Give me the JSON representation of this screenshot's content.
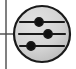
{
  "canvas": {
    "width": 76,
    "height": 69,
    "background_color": "#ffffff",
    "title": "Settings sliders icon"
  },
  "colors": {
    "stroke": "#1a1a1a",
    "circle_fill": "#d4d4d4",
    "circle_fill_highlight": "#e2e2e2",
    "circle_fill_shade": "#bdbdbd",
    "knob_fill": "#111111",
    "track": "#1a1a1a",
    "connector": "#4a4a4a",
    "background": "#ffffff"
  },
  "connector": {
    "vertical_line": {
      "label": "vertical-connector-line",
      "x": 6,
      "y1": 0,
      "y2": 69,
      "width": 1.4,
      "color": "#4a4a4a"
    },
    "horizontal_stub": {
      "label": "horizontal-connector-stub",
      "y": 34,
      "x1": 0,
      "x2": 15,
      "width": 1.4,
      "color": "#4a4a4a"
    }
  },
  "circle": {
    "label": "settings-circle",
    "center_x": 42,
    "center_y": 34,
    "radius_x": 28,
    "radius_y": 28,
    "stroke_width": 2.2,
    "fill": "#d4d4d4",
    "stroke": "#1a1a1a"
  },
  "sliders": {
    "count": 3,
    "track_stroke_width": 2.2,
    "knob_radius": 4.2,
    "knob_stroke_width": 1.4,
    "items": [
      {
        "name": "slider-row-1",
        "label": "Slider 1",
        "y": 22,
        "track_x1": 20,
        "track_x2": 64,
        "knob_x": 39,
        "value_percent": 43
      },
      {
        "name": "slider-row-2",
        "label": "Slider 2",
        "y": 34,
        "track_x1": 19,
        "track_x2": 65,
        "knob_x": 48,
        "value_percent": 63
      },
      {
        "name": "slider-row-3",
        "label": "Slider 3",
        "y": 46,
        "track_x1": 20,
        "track_x2": 64,
        "knob_x": 31,
        "value_percent": 25
      }
    ]
  },
  "accessibility": {
    "icon_name": "settings-sliders-icon",
    "description": "Circular icon containing three horizontal slider controls"
  }
}
